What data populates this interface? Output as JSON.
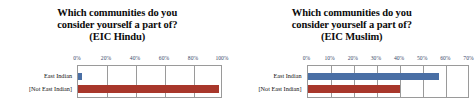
{
  "chart_data": [
    {
      "type": "bar",
      "orientation": "horizontal",
      "title": "Which communities do you consider yourself a part of? (EIC Hindu)",
      "title_lines": [
        "Which communities do you",
        "consider yourself a part of?",
        "(EIC Hindu)"
      ],
      "categories": [
        "East Indian",
        "[Not East Indian]"
      ],
      "values": [
        3,
        97
      ],
      "series": [
        {
          "name": "East Indian",
          "value": 3,
          "color": "#4a6fa5"
        },
        {
          "name": "[Not East Indian]",
          "value": 97,
          "color": "#a8372b"
        }
      ],
      "xlabel": "",
      "ylabel": "",
      "xlim": [
        0,
        100
      ],
      "xticks": [
        0,
        20,
        40,
        60,
        80,
        100
      ],
      "xtick_labels": [
        "0%",
        "20%",
        "40%",
        "60%",
        "80%",
        "100%"
      ],
      "tick_position": "top",
      "grid": true,
      "legend": "none"
    },
    {
      "type": "bar",
      "orientation": "horizontal",
      "title": "Which communities do you consider yourself a part of? (EIC Muslim)",
      "title_lines": [
        "Which communities do you",
        "consider yourself a part of?",
        "(EIC Muslim)"
      ],
      "categories": [
        "East Indian",
        "[Not East Indian]"
      ],
      "values": [
        57,
        40
      ],
      "series": [
        {
          "name": "East Indian",
          "value": 57,
          "color": "#4a6fa5"
        },
        {
          "name": "[Not East Indian]",
          "value": 40,
          "color": "#a8372b"
        }
      ],
      "xlabel": "",
      "ylabel": "",
      "xlim": [
        0,
        70
      ],
      "xticks": [
        0,
        10,
        20,
        30,
        40,
        50,
        60,
        70
      ],
      "xtick_labels": [
        "0%",
        "10%",
        "20%",
        "30%",
        "40%",
        "50%",
        "60%",
        "70%"
      ],
      "tick_position": "top",
      "grid": true,
      "legend": "none"
    }
  ],
  "colors": {
    "bar_blue": "#4a6fa5",
    "bar_red": "#a8372b",
    "gridline": "#9a9a9a",
    "tick_text": "#3a4a6b",
    "title_text": "#0b0b0b",
    "background": "#ffffff"
  }
}
